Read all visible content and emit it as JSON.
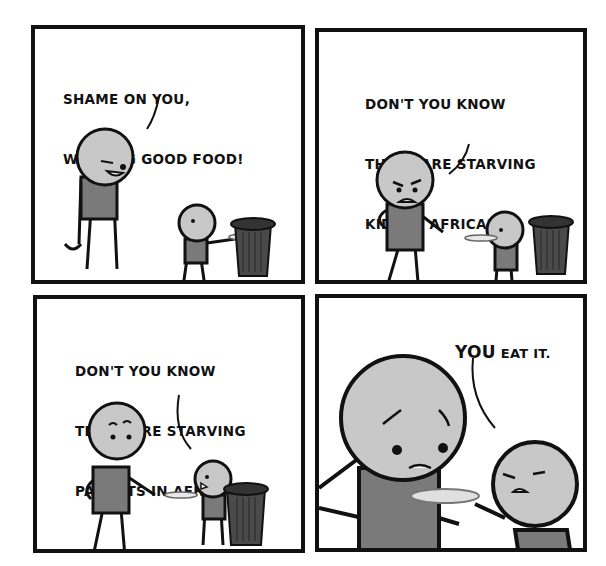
{
  "comic": {
    "panel_count": 4,
    "colors": {
      "border": "#111111",
      "skin": "#c8c8c8",
      "shirt": "#7a7a7a",
      "trash_can": "#4a4a4a",
      "background": "#ffffff"
    },
    "panels": [
      {
        "index": 1,
        "speech_lines": [
          "SHAME ON YOU,",
          "WASTING GOOD FOOD!"
        ],
        "speaker": "adult",
        "scene": "adult scolds child scraping plate into trash can"
      },
      {
        "index": 2,
        "speech_lines": [
          "DON'T YOU KNOW",
          "THERE ARE STARVING",
          "KIDS IN AFRICA?!"
        ],
        "speaker": "adult",
        "scene": "angry adult points at child holding plate near trash can"
      },
      {
        "index": 3,
        "speech_lines": [
          "DON'T YOU KNOW",
          "THERE ARE STARVING",
          "PARENTS IN AFRICA?"
        ],
        "speaker": "child",
        "scene": "child replies holding plate; adult looks surprised"
      },
      {
        "index": 4,
        "speech_emphasis": "YOU",
        "speech_rest": " EAT IT.",
        "speaker": "child",
        "scene": "child pushes plate toward sad adult close-up"
      }
    ]
  }
}
